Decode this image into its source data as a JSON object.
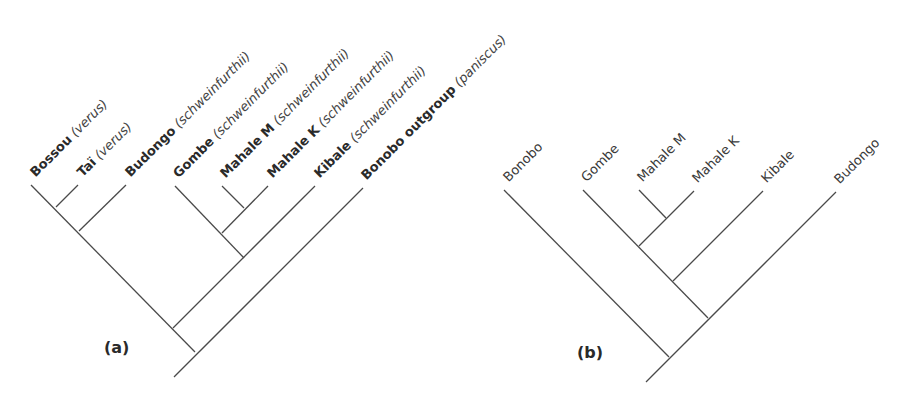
{
  "figure": {
    "panel_a": {
      "label": "(a)",
      "tips": [
        {
          "name": "Bossou",
          "subspecies": "(verus)"
        },
        {
          "name": "Taï",
          "subspecies": "(verus)"
        },
        {
          "name": "Budongo",
          "subspecies": "(schweinfurthii)"
        },
        {
          "name": "Gombe",
          "subspecies": "(schweinfurthii)"
        },
        {
          "name": "Mahale M",
          "subspecies": "(schweinfurthii)"
        },
        {
          "name": "Mahale K",
          "subspecies": "(schweinfurthii)"
        },
        {
          "name": "Kibale",
          "subspecies": "(schweinfurthii)"
        },
        {
          "name": "Bonobo outgroup",
          "subspecies": "(paniscus)"
        }
      ],
      "topology": "((((Bossou,Taï),Budongo),((Gombe,(Mahale M,Mahale K)),Kibale)),Bonobo outgroup)"
    },
    "panel_b": {
      "label": "(b)",
      "tips": [
        {
          "name": "Bonobo"
        },
        {
          "name": "Gombe"
        },
        {
          "name": "Mahale M"
        },
        {
          "name": "Mahale K"
        },
        {
          "name": "Kibale"
        },
        {
          "name": "Budongo"
        }
      ],
      "topology": "(Bonobo,(((Gombe,(Mahale M,Mahale K)),Kibale),Budongo))"
    }
  }
}
